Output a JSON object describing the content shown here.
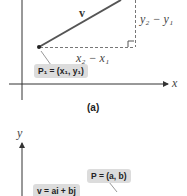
{
  "panel_a": {
    "caption": "(a)",
    "vector_label": "v",
    "dy_label": "y₂ − y₁",
    "dx_label": "x₂ − x₁",
    "point_label": "P₁ = (x₁, y₁)",
    "x_axis_label": "x"
  },
  "panel_b": {
    "y_axis_label": "y",
    "point_label": "P = (a, b)",
    "vector_label": "v = ai + bj"
  },
  "colors": {
    "vector": "#555555",
    "axis": "#333333",
    "dashed": "#777777",
    "label_box": "#dcdcdc"
  }
}
